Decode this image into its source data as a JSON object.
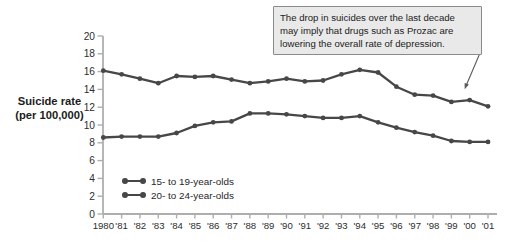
{
  "colors": {
    "line": "#474747",
    "axis": "#aeaeae",
    "tick_text": "#2d2d2d",
    "annotation_bg": "#e9e9e9",
    "annotation_border": "#8a8a8a",
    "arrow": "#5a5a5a"
  },
  "chart_data": {
    "type": "line",
    "title": "",
    "ylabel": "Suicide rate (per 100,000)",
    "ylabel_line1": "Suicide rate",
    "ylabel_line2": "(per 100,000)",
    "ylim": [
      0,
      20
    ],
    "ytick_step": 2,
    "grid": false,
    "legend_position": "inside-lower-left",
    "years": [
      1980,
      1981,
      1982,
      1983,
      1984,
      1985,
      1986,
      1987,
      1988,
      1989,
      1990,
      1991,
      1992,
      1993,
      1994,
      1995,
      1996,
      1997,
      1998,
      1999,
      2000,
      2001
    ],
    "x_tick_labels": [
      "1980",
      "'81",
      "'82",
      "'83",
      "'84",
      "'85",
      "'86",
      "'87",
      "'88",
      "'89",
      "'90",
      "'91",
      "'92",
      "'93",
      "'94",
      "'95",
      "'96",
      "'97",
      "'98",
      "'99",
      "'00",
      "'01"
    ],
    "series": [
      {
        "name": "15- to 19-year-olds",
        "values": [
          8.6,
          8.7,
          8.7,
          8.7,
          9.1,
          9.9,
          10.3,
          10.4,
          11.3,
          11.3,
          11.2,
          11.0,
          10.8,
          10.8,
          11.0,
          10.3,
          9.7,
          9.2,
          8.8,
          8.2,
          8.1,
          8.1
        ]
      },
      {
        "name": "20- to 24-year-olds",
        "values": [
          16.1,
          15.7,
          15.2,
          14.7,
          15.5,
          15.4,
          15.5,
          15.1,
          14.7,
          14.9,
          15.2,
          14.9,
          15.0,
          15.7,
          16.2,
          15.9,
          14.3,
          13.4,
          13.3,
          12.6,
          12.8,
          12.1
        ]
      }
    ],
    "annotation_lines": [
      "The drop in suicides over the last decade",
      "may imply that drugs such as Prozac are",
      "lowering the overall rate of depression."
    ]
  }
}
